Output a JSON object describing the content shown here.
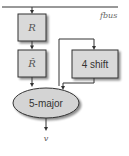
{
  "diagram": {
    "bus": {
      "label": "fbus"
    },
    "nodes": [
      {
        "id": "R",
        "label": "R",
        "shape": "box"
      },
      {
        "id": "Rhat",
        "label": "R̂",
        "shape": "box"
      },
      {
        "id": "shift",
        "label": "4 shift",
        "shape": "box"
      },
      {
        "id": "major",
        "label": "5-major",
        "shape": "ellipse"
      }
    ],
    "edges": [
      {
        "from": "fbus",
        "to": "R"
      },
      {
        "from": "R",
        "to": "Rhat"
      },
      {
        "from": "fbus-branch",
        "to": "shift"
      },
      {
        "from": "Rhat",
        "to": "major"
      },
      {
        "from": "shift",
        "to": "major"
      },
      {
        "from": "major",
        "to": "v"
      }
    ],
    "output": {
      "label": "v"
    },
    "colors": {
      "box_fill": "#d9d9d9",
      "box_stroke": "#333333",
      "ellipse_fill": "#d4d4d4",
      "line": "#333333"
    }
  }
}
